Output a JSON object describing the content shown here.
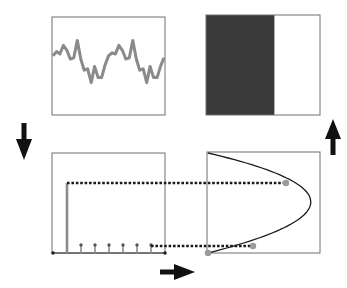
{
  "diagram": {
    "colors": {
      "frame": "#6e6e6e",
      "signal": "#8a8a8a",
      "dark_fill": "#3a3a3a",
      "stem": "#8c8c8c",
      "dotted": "#1a1a1a",
      "curve": "#1a1a1a",
      "marker": "#9a9a9a",
      "arrow": "#111111"
    },
    "panels": {
      "signal": {
        "label": "noisy-periodic-signal",
        "values": [
          0.55,
          0.62,
          0.58,
          0.72,
          0.64,
          0.5,
          0.52,
          0.8,
          0.5,
          0.32,
          0.34,
          0.12,
          0.38,
          0.2,
          0.2,
          0.4,
          0.55,
          0.6,
          0.58,
          0.72,
          0.64,
          0.5,
          0.52,
          0.8,
          0.5,
          0.32,
          0.34,
          0.12,
          0.38,
          0.2,
          0.2,
          0.38,
          0.52
        ],
        "ylim": [
          0,
          1
        ]
      },
      "step_field": {
        "label": "half-filled-box",
        "filled_fraction": 0.6
      },
      "impulses": {
        "label": "impulse-train",
        "first_stem_height": 0.7,
        "small_stem_height": 0.08,
        "small_stem_count": 6
      },
      "curve": {
        "label": "parabolic-mapping",
        "markers": [
          {
            "t": 0.0,
            "name": "origin-marker"
          },
          {
            "t": 0.24,
            "name": "lower-marker"
          },
          {
            "t": 0.8,
            "name": "upper-marker"
          }
        ]
      }
    },
    "arrows": {
      "down": "arrow-down",
      "up": "arrow-up",
      "right": "arrow-right"
    }
  }
}
